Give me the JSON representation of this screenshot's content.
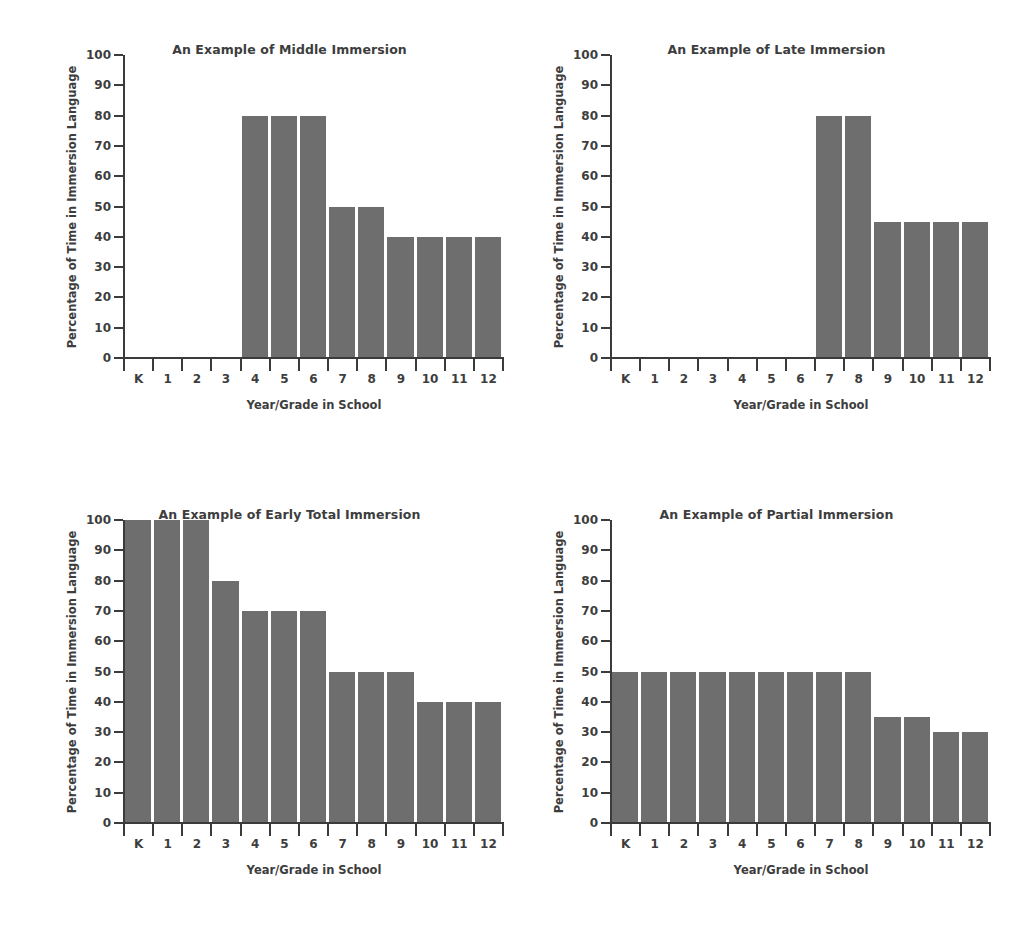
{
  "figure": {
    "background": "#ffffff",
    "bar_color": "#6e6e6e",
    "axis_color": "#3b3b3b",
    "text_color": "#3d3d3d"
  },
  "shared": {
    "xlabel": "Year/Grade in School",
    "ylabel": "Percentage of Time in Immersion Language",
    "categories": [
      "K",
      "1",
      "2",
      "3",
      "4",
      "5",
      "6",
      "7",
      "8",
      "9",
      "10",
      "11",
      "12"
    ],
    "yticks": [
      0,
      10,
      20,
      30,
      40,
      50,
      60,
      70,
      80,
      90,
      100
    ],
    "ylim": [
      0,
      100
    ]
  },
  "chart_data": [
    {
      "type": "bar",
      "position": "top-left",
      "title": "An Example of Middle Immersion",
      "xlabel": "Year/Grade in School",
      "ylabel": "Percentage of Time in Immersion Language",
      "categories": [
        "K",
        "1",
        "2",
        "3",
        "4",
        "5",
        "6",
        "7",
        "8",
        "9",
        "10",
        "11",
        "12"
      ],
      "values": [
        0,
        0,
        0,
        0,
        80,
        80,
        80,
        50,
        50,
        40,
        40,
        40,
        40
      ],
      "ylim": [
        0,
        100
      ],
      "yticks": [
        0,
        10,
        20,
        30,
        40,
        50,
        60,
        70,
        80,
        90,
        100
      ],
      "grid": false,
      "legend": "none"
    },
    {
      "type": "bar",
      "position": "top-right",
      "title": "An Example of Late Immersion",
      "xlabel": "Year/Grade in School",
      "ylabel": "Percentage of Time in Immersion Language",
      "categories": [
        "K",
        "1",
        "2",
        "3",
        "4",
        "5",
        "6",
        "7",
        "8",
        "9",
        "10",
        "11",
        "12"
      ],
      "values": [
        0,
        0,
        0,
        0,
        0,
        0,
        0,
        80,
        80,
        45,
        45,
        45,
        45
      ],
      "ylim": [
        0,
        100
      ],
      "yticks": [
        0,
        10,
        20,
        30,
        40,
        50,
        60,
        70,
        80,
        90,
        100
      ],
      "grid": false,
      "legend": "none"
    },
    {
      "type": "bar",
      "position": "bottom-left",
      "title": "An Example of Early Total Immersion",
      "xlabel": "Year/Grade in School",
      "ylabel": "Percentage of Time in Immersion Language",
      "categories": [
        "K",
        "1",
        "2",
        "3",
        "4",
        "5",
        "6",
        "7",
        "8",
        "9",
        "10",
        "11",
        "12"
      ],
      "values": [
        100,
        100,
        100,
        80,
        70,
        70,
        70,
        50,
        50,
        50,
        40,
        40,
        40
      ],
      "ylim": [
        0,
        100
      ],
      "yticks": [
        0,
        10,
        20,
        30,
        40,
        50,
        60,
        70,
        80,
        90,
        100
      ],
      "grid": false,
      "legend": "none"
    },
    {
      "type": "bar",
      "position": "bottom-right",
      "title": "An Example of Partial Immersion",
      "xlabel": "Year/Grade in School",
      "ylabel": "Percentage of Time in Immersion Language",
      "categories": [
        "K",
        "1",
        "2",
        "3",
        "4",
        "5",
        "6",
        "7",
        "8",
        "9",
        "10",
        "11",
        "12"
      ],
      "values": [
        50,
        50,
        50,
        50,
        50,
        50,
        50,
        50,
        50,
        35,
        35,
        30,
        30
      ],
      "ylim": [
        0,
        100
      ],
      "yticks": [
        0,
        10,
        20,
        30,
        40,
        50,
        60,
        70,
        80,
        90,
        100
      ],
      "grid": false,
      "legend": "none"
    }
  ]
}
